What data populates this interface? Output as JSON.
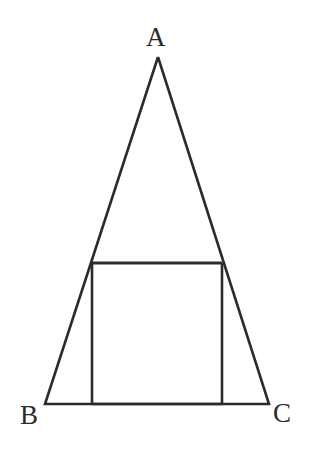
{
  "figure": {
    "background_color": "#ffffff",
    "stroke_color": "#2b2b2b",
    "stroke_width": 2.6,
    "labels": {
      "apex": "A",
      "bottom_left": "B",
      "bottom_right": "C"
    },
    "label_color": "#2b2b2b",
    "points": {
      "A": {
        "x": 158,
        "y": 57
      },
      "B": {
        "x": 45,
        "y": 404
      },
      "C": {
        "x": 269,
        "y": 404
      },
      "square_top_left": {
        "x": 92,
        "y": 263
      },
      "square_top_right": {
        "x": 222,
        "y": 263
      },
      "square_bottom_left": {
        "x": 92,
        "y": 404
      },
      "square_bottom_right": {
        "x": 222,
        "y": 404
      }
    },
    "shapes": [
      {
        "name": "triangle-ABC",
        "kind": "polygon",
        "vertices": "A,B,C"
      },
      {
        "name": "inscribed-square",
        "kind": "polygon",
        "vertices": "square_top_left,square_top_right,square_bottom_right,square_bottom_left"
      }
    ]
  }
}
